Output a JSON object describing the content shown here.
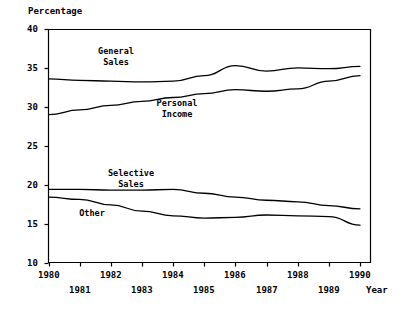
{
  "chart_data": {
    "type": "line",
    "title": "",
    "xlabel": "Year",
    "ylabel": "Percentage",
    "ylim": [
      10,
      40
    ],
    "xlim": [
      1980,
      1990
    ],
    "yticks": [
      10,
      15,
      20,
      25,
      30,
      35,
      40
    ],
    "ytick_labels": [
      "10",
      "15",
      "20",
      "25",
      "30",
      "35",
      "40"
    ],
    "grid": false,
    "legend": "inline-annotations",
    "x": [
      1980,
      1981,
      1982,
      1983,
      1984,
      1985,
      1986,
      1987,
      1988,
      1989,
      1990
    ],
    "xtick_labels": [
      "1980",
      "1981",
      "1982",
      "1983",
      "1984",
      "1985",
      "1986",
      "1987",
      "1988",
      "1989",
      "1990"
    ],
    "series": [
      {
        "name": "General Sales",
        "label_lines": [
          "General",
          "Sales"
        ],
        "values": [
          33.6,
          33.4,
          33.3,
          33.2,
          33.3,
          34.0,
          35.3,
          34.6,
          35.0,
          34.9,
          35.2
        ]
      },
      {
        "name": "Personal Income",
        "label_lines": [
          "Personal",
          "Income"
        ],
        "values": [
          29.0,
          29.6,
          30.2,
          30.7,
          31.2,
          31.7,
          32.2,
          32.0,
          32.3,
          33.3,
          34.0
        ]
      },
      {
        "name": "Selective Sales",
        "label_lines": [
          "Selective",
          "Sales"
        ],
        "values": [
          19.4,
          19.4,
          19.3,
          19.3,
          19.4,
          18.9,
          18.4,
          18.0,
          17.8,
          17.3,
          16.9
        ]
      },
      {
        "name": "Other",
        "label_lines": [
          "Other"
        ],
        "values": [
          18.4,
          18.1,
          17.4,
          16.6,
          16.0,
          15.7,
          15.8,
          16.1,
          16.0,
          15.9,
          14.8
        ]
      }
    ],
    "line_color": "#000000",
    "axis_color": "#000000",
    "background_color": "#ffffff"
  },
  "axes": {
    "y_axis_title": "Percentage",
    "x_axis_title": "Year"
  },
  "ylabels": [
    "40",
    "35",
    "30",
    "25",
    "20",
    "15",
    "10"
  ],
  "xlabels_top": [
    "1980",
    "1982",
    "1984",
    "1986",
    "1988",
    "1990"
  ],
  "xlabels_bottom": [
    "1981",
    "1983",
    "1985",
    "1987",
    "1989"
  ],
  "series_labels": {
    "general_sales_line1": "General",
    "general_sales_line2": "Sales",
    "personal_income_line1": "Personal",
    "personal_income_line2": "Income",
    "selective_sales_line1": "Selective",
    "selective_sales_line2": "Sales",
    "other_line1": "Other"
  }
}
